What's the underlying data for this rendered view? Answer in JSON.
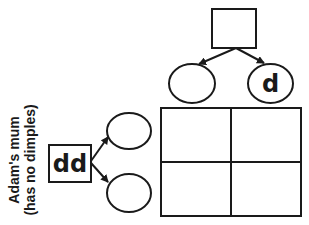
{
  "diagram": {
    "type": "punnett-square",
    "mother": {
      "label_line1": "Adam's mum",
      "label_line2": "(has no dimples)",
      "genotype": "dd",
      "gametes": [
        "",
        ""
      ]
    },
    "father": {
      "genotype": "",
      "gametes": [
        "",
        "d"
      ]
    },
    "grid": {
      "rows": 2,
      "cols": 2,
      "cells": [
        [
          "",
          ""
        ],
        [
          "",
          ""
        ]
      ]
    },
    "colors": {
      "stroke": "#1a1a1a",
      "background": "#ffffff"
    }
  }
}
